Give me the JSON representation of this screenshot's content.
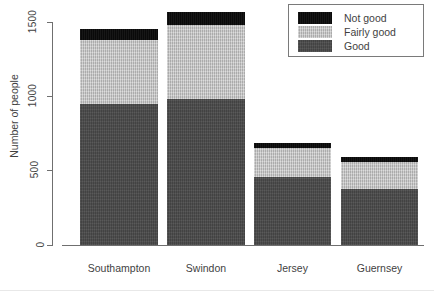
{
  "chart_data": {
    "type": "bar",
    "subtype": "stacked-vertical",
    "title": "",
    "xlabel": "",
    "ylabel": "Number of people",
    "categories": [
      "Southampton",
      "Swindon",
      "Jersey",
      "Guernsey"
    ],
    "ylim": [
      0,
      1500
    ],
    "yticks": [
      0,
      500,
      1000,
      1500
    ],
    "ytick_labels": [
      "0",
      "500",
      "1000",
      "1500"
    ],
    "grid": false,
    "legend_position": "top-right",
    "series": [
      {
        "name": "Good",
        "color": "#4a4a4a",
        "values": [
          950,
          980,
          455,
          375
        ]
      },
      {
        "name": "Fairly good",
        "color": "#c2c2c2",
        "values": [
          430,
          500,
          195,
          185
        ]
      },
      {
        "name": "Not good",
        "color": "#0b0b0b",
        "values": [
          70,
          85,
          35,
          30
        ]
      }
    ],
    "totals": [
      1450,
      1565,
      685,
      590
    ],
    "stack_order_bottom_to_top": [
      "Good",
      "Fairly good",
      "Not good"
    ]
  },
  "axis": {
    "y_title": "Number of people",
    "ticks": [
      {
        "label": "1500",
        "value": 1500
      },
      {
        "label": "1000",
        "value": 1000
      },
      {
        "label": "500",
        "value": 500
      },
      {
        "label": "0",
        "value": 0
      }
    ]
  },
  "xaxis": {
    "labels": [
      {
        "text": "Southampton"
      },
      {
        "text": "Swindon"
      },
      {
        "text": "Jersey"
      },
      {
        "text": "Guernsey"
      }
    ]
  },
  "legend": {
    "items": [
      {
        "label": "Not good",
        "color": "#0b0b0b",
        "swatch": "legend-swatch-not-good"
      },
      {
        "label": "Fairly good",
        "color": "#c2c2c2",
        "swatch": "legend-swatch-fairly-good"
      },
      {
        "label": "Good",
        "color": "#4a4a4a",
        "swatch": "legend-swatch-good"
      }
    ]
  },
  "colors": {
    "good": "#4a4a4a",
    "fairly_good": "#c2c2c2",
    "not_good": "#0b0b0b",
    "axis": "#6f6f6f",
    "text": "#3f3f3f",
    "background": "#ffffff"
  }
}
